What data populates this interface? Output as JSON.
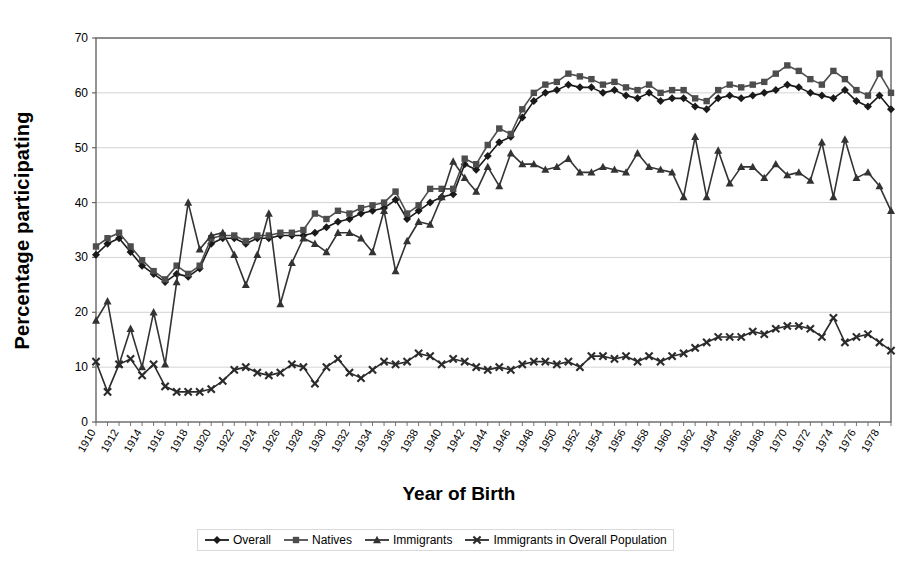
{
  "chart_data": {
    "type": "line",
    "title": "",
    "xlabel": "Year of Birth",
    "ylabel": "Percentage participating",
    "ylim": [
      0,
      70
    ],
    "ytick_step": 10,
    "yticks": [
      0,
      10,
      20,
      30,
      40,
      50,
      60,
      70
    ],
    "grid": true,
    "grid_axis": "y",
    "legend_position": "bottom",
    "xlim": [
      1910,
      1979
    ],
    "xtick_step": 2,
    "x": [
      1910,
      1911,
      1912,
      1913,
      1914,
      1915,
      1916,
      1917,
      1918,
      1919,
      1920,
      1921,
      1922,
      1923,
      1924,
      1925,
      1926,
      1927,
      1928,
      1929,
      1930,
      1931,
      1932,
      1933,
      1934,
      1935,
      1936,
      1937,
      1938,
      1939,
      1940,
      1941,
      1942,
      1943,
      1944,
      1945,
      1946,
      1947,
      1948,
      1949,
      1950,
      1951,
      1952,
      1953,
      1954,
      1955,
      1956,
      1957,
      1958,
      1959,
      1960,
      1961,
      1962,
      1963,
      1964,
      1965,
      1966,
      1967,
      1968,
      1969,
      1970,
      1971,
      1972,
      1973,
      1974,
      1975,
      1976,
      1977,
      1978,
      1979
    ],
    "xticklabels": [
      "1910",
      "1912",
      "1914",
      "1916",
      "1918",
      "1920",
      "1922",
      "1924",
      "1926",
      "1928",
      "1930",
      "1932",
      "1934",
      "1936",
      "1938",
      "1940",
      "1942",
      "1944",
      "1946",
      "1948",
      "1950",
      "1952",
      "1954",
      "1956",
      "1958",
      "1960",
      "1962",
      "1964",
      "1966",
      "1968",
      "1970",
      "1972",
      "1974",
      "1976",
      "1978"
    ],
    "series": [
      {
        "name": "Overall",
        "marker": "diamond",
        "color": "#1a1a1a",
        "values": [
          30.5,
          32.5,
          33.5,
          31.0,
          28.5,
          27.0,
          25.5,
          27.0,
          26.5,
          28.0,
          32.5,
          33.5,
          33.5,
          32.5,
          33.5,
          33.5,
          34.0,
          34.0,
          34.0,
          34.5,
          35.5,
          36.5,
          37.0,
          38.0,
          38.5,
          39.0,
          40.5,
          37.0,
          38.5,
          40.0,
          41.0,
          41.5,
          47.0,
          46.0,
          48.5,
          51.0,
          52.0,
          55.5,
          58.5,
          60.0,
          60.5,
          61.5,
          61.0,
          61.0,
          60.0,
          60.5,
          59.5,
          59.0,
          60.0,
          58.5,
          59.0,
          59.0,
          57.5,
          57.0,
          59.0,
          59.5,
          59.0,
          59.5,
          60.0,
          60.5,
          61.5,
          61.0,
          60.0,
          59.5,
          59.0,
          60.5,
          58.5,
          57.5,
          59.5,
          57.0
        ]
      },
      {
        "name": "Natives",
        "marker": "square",
        "color": "#4d4d4d",
        "values": [
          32.0,
          33.5,
          34.5,
          32.0,
          29.5,
          27.5,
          26.0,
          28.5,
          27.0,
          28.5,
          33.5,
          34.0,
          34.0,
          33.0,
          34.0,
          34.0,
          34.5,
          34.5,
          35.0,
          38.0,
          37.0,
          38.5,
          38.0,
          39.0,
          39.5,
          40.0,
          42.0,
          38.0,
          39.5,
          42.5,
          42.5,
          42.5,
          48.0,
          47.0,
          50.5,
          53.5,
          52.5,
          57.0,
          60.0,
          61.5,
          62.0,
          63.5,
          63.0,
          62.5,
          61.5,
          62.0,
          61.0,
          60.5,
          61.5,
          60.0,
          60.5,
          60.5,
          59.0,
          58.5,
          60.5,
          61.5,
          61.0,
          61.5,
          62.0,
          63.5,
          65.0,
          64.0,
          62.5,
          61.5,
          64.0,
          62.5,
          60.5,
          59.5,
          63.5,
          60.0
        ]
      },
      {
        "name": "Immigrants",
        "marker": "triangle",
        "color": "#333333",
        "values": [
          18.5,
          22.0,
          10.5,
          17.0,
          10.0,
          20.0,
          10.5,
          25.5,
          40.0,
          31.5,
          34.0,
          34.5,
          30.5,
          25.0,
          30.5,
          38.0,
          21.5,
          29.0,
          33.5,
          32.5,
          31.0,
          34.5,
          34.5,
          33.5,
          31.0,
          38.5,
          27.5,
          33.0,
          36.5,
          36.0,
          41.0,
          47.5,
          44.5,
          42.0,
          46.5,
          43.0,
          49.0,
          47.0,
          47.0,
          46.0,
          46.5,
          48.0,
          45.5,
          45.5,
          46.5,
          46.0,
          45.5,
          49.0,
          46.5,
          46.0,
          45.5,
          41.0,
          52.0,
          41.0,
          49.5,
          43.5,
          46.5,
          46.5,
          44.5,
          47.0,
          45.0,
          45.5,
          44.0,
          51.0,
          41.0,
          51.5,
          44.5,
          45.5,
          43.0,
          38.5
        ]
      },
      {
        "name": "Immigrants in Overall Population",
        "marker": "cross",
        "color": "#2b2b2b",
        "values": [
          11.0,
          5.5,
          10.5,
          11.5,
          8.5,
          10.5,
          6.5,
          5.5,
          5.5,
          5.5,
          6.0,
          7.5,
          9.5,
          10.0,
          9.0,
          8.5,
          9.0,
          10.5,
          10.0,
          7.0,
          10.0,
          11.5,
          9.0,
          8.0,
          9.5,
          11.0,
          10.5,
          11.0,
          12.5,
          12.0,
          10.5,
          11.5,
          11.0,
          10.0,
          9.5,
          10.0,
          9.5,
          10.5,
          11.0,
          11.0,
          10.5,
          11.0,
          10.0,
          12.0,
          12.0,
          11.5,
          12.0,
          11.0,
          12.0,
          11.0,
          12.0,
          12.5,
          13.5,
          14.5,
          15.5,
          15.5,
          15.5,
          16.5,
          16.0,
          17.0,
          17.5,
          17.5,
          17.0,
          15.5,
          19.0,
          14.5,
          15.5,
          16.0,
          14.5,
          13.0
        ]
      }
    ]
  },
  "legend": {
    "items": [
      {
        "label": "Overall"
      },
      {
        "label": "Natives"
      },
      {
        "label": "Immigrants"
      },
      {
        "label": "Immigrants in Overall Population"
      }
    ]
  }
}
